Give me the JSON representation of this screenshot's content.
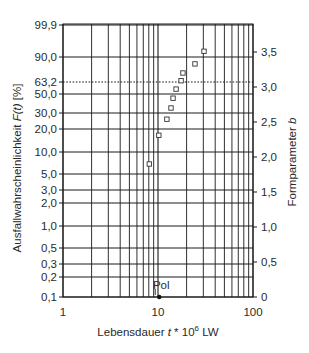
{
  "chart_data": {
    "type": "scatter",
    "title": "",
    "xlabel": "Lebensdauer t * 10^6 LW",
    "xlabel_parts": {
      "pre": "Lebensdauer ",
      "var": "t",
      "mid": " * 10",
      "sup": "6",
      "post": " LW"
    },
    "ylabel_left": "Ausfallwahrscheinlichkeit F(t) [%]",
    "ylabel_left_parts": {
      "pre": "Ausfallwahrscheinlichkeit ",
      "var": "F(t)",
      "post": " [%]"
    },
    "ylabel_right": "Formparameter b",
    "ylabel_right_parts": {
      "pre": "Formparameter ",
      "var": "b"
    },
    "x_scale": "log",
    "xlim": [
      1,
      100
    ],
    "x_tick_labels": [
      "1",
      "10",
      "100"
    ],
    "x_ticks": [
      1,
      10,
      100
    ],
    "x_gridlines": [
      1,
      2,
      3,
      4,
      5,
      6,
      7,
      8,
      9,
      10,
      20,
      30,
      40,
      50,
      60,
      70,
      80,
      90,
      100
    ],
    "y_left_scale": "weibull",
    "y_left_ticks": [
      {
        "value": 99.9,
        "label": "99,9"
      },
      {
        "value": 90.0,
        "label": "90,0"
      },
      {
        "value": 63.2,
        "label": "63,2",
        "dotted": true
      },
      {
        "value": 50.0,
        "label": "50,0"
      },
      {
        "value": 30.0,
        "label": "30,0"
      },
      {
        "value": 20.0,
        "label": "20,0"
      },
      {
        "value": 10.0,
        "label": "10,0"
      },
      {
        "value": 5.0,
        "label": "5,0"
      },
      {
        "value": 3.0,
        "label": "3,0"
      },
      {
        "value": 2.0,
        "label": "2,0"
      },
      {
        "value": 1.0,
        "label": "1,0"
      },
      {
        "value": 0.5,
        "label": "0,5"
      },
      {
        "value": 0.3,
        "label": "0,3"
      },
      {
        "value": 0.2,
        "label": "0,2"
      },
      {
        "value": 0.1,
        "label": "0,1"
      }
    ],
    "y_right_ticks": [
      {
        "value": 0,
        "label": "0"
      },
      {
        "value": 0.5,
        "label": "0,5"
      },
      {
        "value": 1.0,
        "label": "1,0"
      },
      {
        "value": 1.5,
        "label": "1,5"
      },
      {
        "value": 2.0,
        "label": "2,0"
      },
      {
        "value": 2.5,
        "label": "2,5"
      },
      {
        "value": 3.0,
        "label": "3,0"
      },
      {
        "value": 3.5,
        "label": "3,5"
      }
    ],
    "y_right_lim": [
      0,
      3.8
    ],
    "grid": true,
    "legend": null,
    "series": [
      {
        "name": "Formparameter b",
        "marker": "open-square",
        "axis": "right",
        "points": [
          {
            "t": 8.1,
            "b": 1.9
          },
          {
            "t": 10.2,
            "b": 2.31
          },
          {
            "t": 12.4,
            "b": 2.54
          },
          {
            "t": 13.7,
            "b": 2.7
          },
          {
            "t": 14.4,
            "b": 2.84
          },
          {
            "t": 15.5,
            "b": 2.97
          },
          {
            "t": 17.5,
            "b": 3.09
          },
          {
            "t": 18.3,
            "b": 3.2
          },
          {
            "t": 24.5,
            "b": 3.33
          },
          {
            "t": 30.5,
            "b": 3.51
          }
        ]
      }
    ],
    "annotations": [
      {
        "label": "Pol",
        "t": 10.3,
        "b": 0,
        "marker": "filled-dot"
      }
    ]
  },
  "layout": {
    "plot_left": 63,
    "plot_right": 253,
    "plot_top": 24,
    "plot_bottom": 297,
    "px_per_decade": 95,
    "px_per_b": 70,
    "y_left_px": {
      "99.9": 25,
      "90.0": 57,
      "63.2": 82,
      "50.0": 94,
      "30.0": 113,
      "20.0": 129,
      "10.0": 152,
      "5.0": 174,
      "3.0": 190,
      "2.0": 203,
      "1.0": 226,
      "0.5": 248,
      "0.3": 264,
      "0.2": 277,
      "0.1": 297
    },
    "colors": {
      "grid": "#1a1a1a",
      "text": "#2a2a2a",
      "marker": "#333333",
      "background": "#ffffff"
    }
  }
}
